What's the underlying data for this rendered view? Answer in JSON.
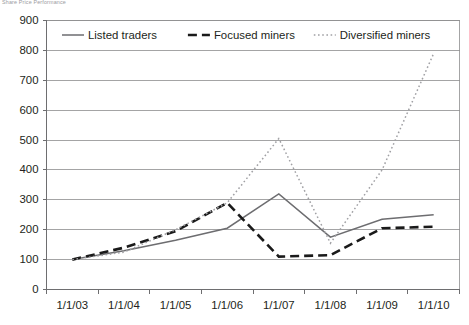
{
  "figure": {
    "caption": "Share Price Performance"
  },
  "chart_data": {
    "type": "line",
    "title": "",
    "xlabel": "",
    "ylabel": "",
    "categories": [
      "1/1/03",
      "1/1/04",
      "1/1/05",
      "1/1/06",
      "1/1/07",
      "1/1/08",
      "1/1/09",
      "1/1/10"
    ],
    "ylim": [
      0,
      900
    ],
    "yticks": [
      0,
      100,
      200,
      300,
      400,
      500,
      600,
      700,
      800,
      900
    ],
    "ytick_labels": [
      "0",
      "100",
      "200",
      "300",
      "400",
      "500",
      "600",
      "700",
      "800",
      "900"
    ],
    "grid": true,
    "legend_position": "top-inside",
    "series": [
      {
        "name": "Listed traders",
        "style": "solid",
        "color": "#6d6d70",
        "values": [
          100,
          130,
          165,
          205,
          320,
          175,
          235,
          250
        ]
      },
      {
        "name": "Focused miners",
        "style": "dashed",
        "color": "#1a1a1a",
        "values": [
          100,
          140,
          195,
          290,
          110,
          115,
          205,
          210
        ]
      },
      {
        "name": "Diversified miners",
        "style": "dotted",
        "color": "#a0a0a4",
        "values": [
          100,
          125,
          200,
          290,
          505,
          155,
          400,
          790
        ]
      }
    ]
  }
}
